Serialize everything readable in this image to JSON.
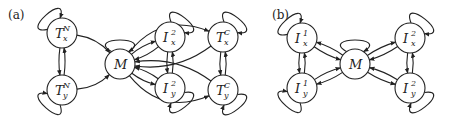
{
  "panels": [
    {
      "label": "(a)",
      "nodes": [
        {
          "id": "TxN",
          "base": "T",
          "sup": "N",
          "sub": "x"
        },
        {
          "id": "TyN",
          "base": "T",
          "sup": "N",
          "sub": "y"
        },
        {
          "id": "M",
          "base": "M",
          "sup": "",
          "sub": ""
        },
        {
          "id": "Ix2",
          "base": "I",
          "sup": "2",
          "sub": "x"
        },
        {
          "id": "Iy2",
          "base": "I",
          "sup": "2",
          "sub": "y"
        },
        {
          "id": "TxC",
          "base": "T",
          "sup": "C",
          "sub": "x"
        },
        {
          "id": "TyC",
          "base": "T",
          "sup": "C",
          "sub": "y"
        }
      ]
    },
    {
      "label": "(b)",
      "nodes": [
        {
          "id": "Ix1",
          "base": "I",
          "sup": "1",
          "sub": "x"
        },
        {
          "id": "Iy1",
          "base": "I",
          "sup": "1",
          "sub": "y"
        },
        {
          "id": "M",
          "base": "M",
          "sup": "",
          "sub": ""
        },
        {
          "id": "Ix2",
          "base": "I",
          "sup": "2",
          "sub": "x"
        },
        {
          "id": "Iy2",
          "base": "I",
          "sup": "2",
          "sub": "y"
        }
      ]
    }
  ]
}
